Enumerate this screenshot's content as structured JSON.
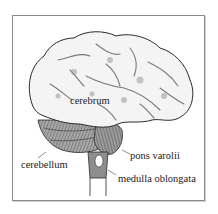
{
  "diagram": {
    "labels": {
      "cerebrum": "cerebrum",
      "cerebellum": "cerebellum",
      "pons": "pons varolii",
      "medulla": "medulla oblongata"
    },
    "colors": {
      "cerebrum_fill": "#f4f4f4",
      "sulcus_shade": "#8e8e8e",
      "cerebellum_fill": "#9a9a9a",
      "outline": "#2a2a2a",
      "frame": "#8a8a8a"
    }
  }
}
